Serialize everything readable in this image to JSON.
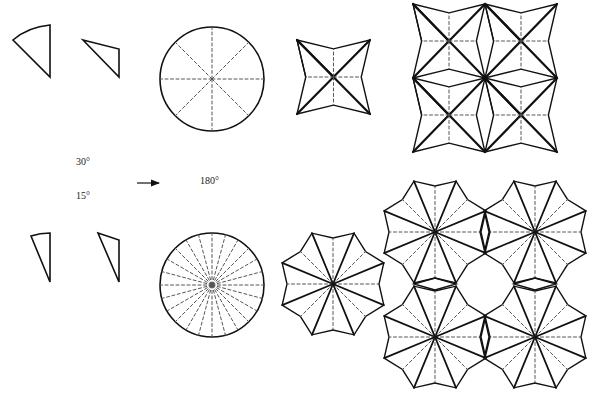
{
  "figure": {
    "type": "geometric-construction",
    "stroke_color": "#111111",
    "dash_color": "#555555",
    "background": "#ffffff"
  },
  "labels": {
    "angle_large": "30°",
    "angle_small": "15°",
    "rotation": "180°"
  },
  "rows": [
    {
      "name": "four-point",
      "sector_angle_deg": 30,
      "circle_divisions": 8,
      "star_points": 4,
      "tiling": "2x2"
    },
    {
      "name": "eight-point",
      "sector_angle_deg": 15,
      "circle_divisions": 24,
      "star_points": 8,
      "tiling": "2x2"
    }
  ]
}
